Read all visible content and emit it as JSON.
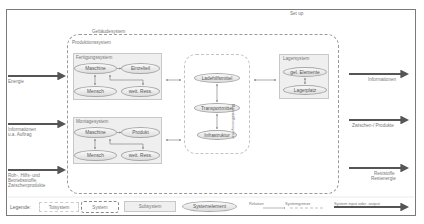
{
  "diagram": {
    "title_outer": "Set up",
    "building_system_label": "Gebäudesystem",
    "production_system_label": "Produktionssystem",
    "manufacturing": {
      "label": "Fertigungssystem",
      "elements": [
        "Maschine",
        "Einzelteil",
        "Mensch",
        "weit. Ress."
      ]
    },
    "assembly": {
      "label": "Montagesystem",
      "elements": [
        "Maschine",
        "Produkt",
        "Mensch",
        "weit. Ress."
      ]
    },
    "material_flow": {
      "label": "Materialflusssystem",
      "elements": [
        "Ladehilfsmittel",
        "Transportmittel",
        "Infrastruktur"
      ]
    },
    "storage": {
      "label": "Lagersystem",
      "elements": [
        "gel. Elemente",
        "Lagerplatz"
      ]
    },
    "inputs": [
      {
        "label_lines": [
          "Energie"
        ]
      },
      {
        "label_lines": [
          "Informationen",
          "u.a. Auftrag"
        ]
      },
      {
        "label_lines": [
          "Roh-, Hilfs- und",
          "Betriebsstoffe,",
          "Zwischenprodukte"
        ]
      }
    ],
    "outputs": [
      {
        "label_lines": [
          "Informationen"
        ]
      },
      {
        "label_lines": [
          "Zwischen-/ Produkte"
        ]
      },
      {
        "label_lines": [
          "Reststoffe",
          "Restenergie"
        ]
      }
    ]
  },
  "legend": {
    "title": "Legende:",
    "items": {
      "total_system": "Totsystem",
      "system": "System",
      "subsystem": "Subsystem",
      "system_element": "Systemelement",
      "relation": "Relation",
      "system_boundary": "Systemgrenze",
      "io": "System input oder -output"
    }
  },
  "colors": {
    "frame": "#7a7a7a",
    "arrow": "#555555",
    "subsystem_fill": "#efefef",
    "element_fill_top": "#fafafa",
    "element_fill_bottom": "#dcdcdc"
  }
}
